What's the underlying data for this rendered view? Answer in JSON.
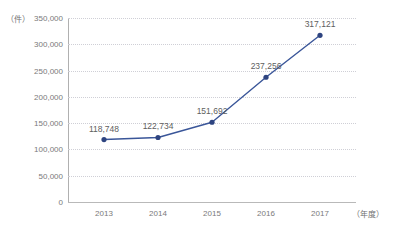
{
  "chart_data": {
    "type": "line",
    "title": "",
    "xlabel": "（年度）",
    "ylabel": "（件）",
    "categories": [
      "2013",
      "2014",
      "2015",
      "2016",
      "2017"
    ],
    "values": [
      118748,
      122734,
      151692,
      237256,
      317121
    ],
    "value_labels": [
      "118,748",
      "122,734",
      "151,692",
      "237,256",
      "317,121"
    ],
    "series": [
      {
        "name": "件数",
        "values": [
          118748,
          122734,
          151692,
          237256,
          317121
        ]
      }
    ],
    "ylim": [
      0,
      350000
    ],
    "y_ticks": [
      0,
      50000,
      100000,
      150000,
      200000,
      250000,
      300000,
      350000
    ],
    "y_tick_labels": [
      "0",
      "50,000",
      "100,000",
      "150,000",
      "200,000",
      "250,000",
      "300,000",
      "350,000"
    ],
    "grid": true,
    "legend": "none",
    "colors": {
      "line": "#3a5699",
      "marker": "#2e4480",
      "grid": "#cfcfd6",
      "axis": "#b0b0b0",
      "text": "#7a7a7a",
      "value_text": "#5e5e5e",
      "background": "#ffffff"
    }
  }
}
